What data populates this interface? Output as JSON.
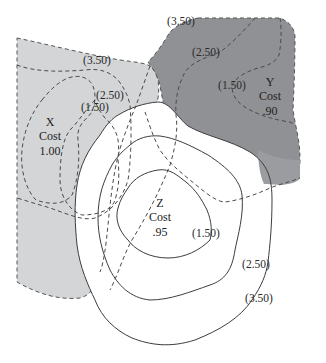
{
  "diagram": {
    "type": "isocost-contour-map",
    "colors": {
      "x_fill": "#d3d5d7",
      "y_fill": "#8f9194",
      "y_fill_light": "#a9abad",
      "line": "#4a4a4a",
      "background": "#ffffff"
    },
    "sites": [
      {
        "id": "X",
        "name": "X",
        "cost_label": "Cost",
        "cost": "1.00",
        "line_style": "dashed",
        "fill": "light-gray"
      },
      {
        "id": "Y",
        "name": "Y",
        "cost_label": "Cost",
        "cost": ".90",
        "line_style": "dashed",
        "fill": "dark-gray"
      },
      {
        "id": "Z",
        "name": "Z",
        "cost_label": "Cost",
        "cost": ".95",
        "line_style": "solid",
        "fill": "none"
      }
    ],
    "contour_labels": {
      "x": {
        "c350": "(3.50)",
        "c250": "(2.50)",
        "c150": "(1.50)"
      },
      "y": {
        "c350": "(3.50)",
        "c250": "(2.50)",
        "c150": "(1.50)"
      },
      "z": {
        "c150": "(1.50)",
        "c250": "(2.50)",
        "c350": "(3.50)"
      }
    }
  }
}
